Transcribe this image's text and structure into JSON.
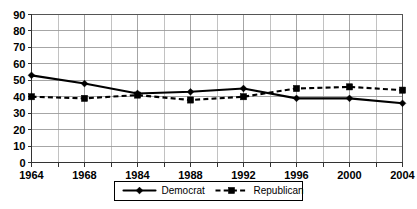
{
  "chart_data": {
    "type": "line",
    "title": "",
    "xlabel": "",
    "ylabel": "",
    "x": [
      "1964",
      "1968",
      "1984",
      "1988",
      "1992",
      "1996",
      "2000",
      "2004"
    ],
    "categories": [
      "1964",
      "1968",
      "1984",
      "1988",
      "1992",
      "1996",
      "2000",
      "2004"
    ],
    "series": [
      {
        "name": "Democrat",
        "marker": "diamond",
        "linestyle": "solid",
        "color": "#000000",
        "values": [
          53,
          48,
          42,
          43,
          45,
          39,
          39,
          36
        ]
      },
      {
        "name": "Republican",
        "marker": "square",
        "linestyle": "dashed",
        "color": "#000000",
        "values": [
          40,
          39,
          41,
          38,
          40,
          45,
          46,
          44
        ]
      }
    ],
    "ylim": [
      0,
      90
    ],
    "yticks": [
      0,
      10,
      20,
      30,
      40,
      50,
      60,
      70,
      80,
      90
    ],
    "ytick_labels": [
      "0",
      "10",
      "20",
      "30",
      "40",
      "50",
      "60",
      "70",
      "80",
      "90"
    ],
    "xtick_labels": [
      "1964",
      "1968",
      "1984",
      "1988",
      "1992",
      "1996",
      "2000",
      "2004"
    ],
    "grid": true,
    "grid_minor_vertical": true,
    "legend_position": "bottom-center",
    "legend_entries": [
      "Democrat",
      "Republican"
    ]
  },
  "legend": {
    "democrat_label": "Democrat",
    "republican_label": "Republican"
  }
}
